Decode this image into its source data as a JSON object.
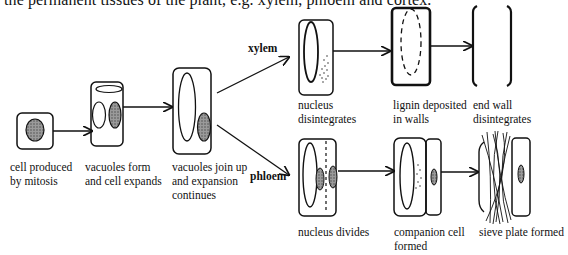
{
  "intro_text": "the permanent tissues of the plant, e.g. xylem, phloem and cortex.",
  "branches": {
    "xylem": "xylem",
    "phloem": "phloem"
  },
  "stages": {
    "mitosis": {
      "line1": "cell produced",
      "line2": "by mitosis"
    },
    "vacuoles_form": {
      "line1": "vacuoles form",
      "line2": "and cell expands"
    },
    "vacuoles_join": {
      "line1": "vacuoles join up",
      "line2": "and expansion",
      "line3": "continues"
    },
    "xylem_nucleus": {
      "line1": "nucleus",
      "line2": "disintegrates"
    },
    "xylem_lignin": {
      "line1": "lignin deposited",
      "line2": "in walls"
    },
    "xylem_endwall": {
      "line1": "end wall",
      "line2": "disintegrates"
    },
    "phloem_divides": {
      "line1": "nucleus divides"
    },
    "phloem_companion": {
      "line1": "companion cell",
      "line2": "formed"
    },
    "phloem_sieve": {
      "line1": "sieve plate formed"
    }
  },
  "colors": {
    "ink": "#111111",
    "nucleus_fill": "#8a8a8a",
    "background": "#ffffff"
  }
}
